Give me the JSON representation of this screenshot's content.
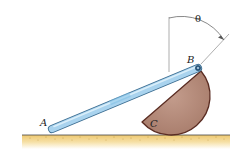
{
  "figure": {
    "type": "mechanics-diagram",
    "labels": {
      "point_a": "A",
      "point_b": "B",
      "disk_c": "C",
      "angle": "θ"
    },
    "colors": {
      "rod_fill": "#a9d3ee",
      "rod_highlight": "#d8eefb",
      "rod_outline": "#3d6e92",
      "disk_fill": "#b58c7c",
      "disk_outline": "#5a2c22",
      "ground_line": "#444444",
      "ground_fill": "#f2d58c",
      "dimension_line": "#555555"
    }
  }
}
